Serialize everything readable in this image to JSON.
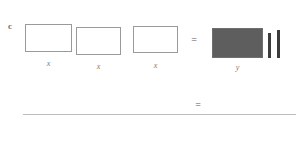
{
  "diagram": {
    "part_label": "c",
    "left_side": {
      "boxes": [
        {
          "label": "x"
        },
        {
          "label": "x"
        },
        {
          "label": "x"
        }
      ]
    },
    "operators": {
      "equals_top": "=",
      "equals_bottom": "="
    },
    "right_side": {
      "shaded_box": {
        "label": "y"
      },
      "unit_bars": [
        {
          "name": "unit-bar-1"
        },
        {
          "name": "unit-bar-2"
        }
      ]
    },
    "colors": {
      "open_box_border": "#9a9a9a",
      "shaded_box_fill": "#5e5e5e",
      "shaded_box_border": "#6f6f6f",
      "unit_bar_fill": "#3c3c3c",
      "rule": "#bdbdbd",
      "label_text": "#7b7b7b",
      "part_label_text": "#6a6a6a"
    }
  }
}
